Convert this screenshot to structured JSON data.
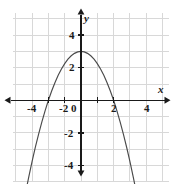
{
  "chart_data": {
    "type": "line",
    "title": "",
    "subtitle": "",
    "xlabel": "x",
    "ylabel": "y",
    "xlim": [
      -4.95,
      5.4
    ],
    "ylim": [
      -5.25,
      5.4
    ],
    "grid": true,
    "grid_step": 1,
    "legend": null,
    "xticks": [
      -4,
      -2,
      2,
      4
    ],
    "yticks": [
      4,
      2,
      -2,
      -4
    ],
    "xtick_labels": [
      "-4",
      "-2",
      "2",
      "4"
    ],
    "ytick_labels": [
      "4",
      "2",
      "-2",
      "-4"
    ],
    "origin_label": "0",
    "series": [
      {
        "name": "parabola",
        "equation": "y = -0.75x^2 + 3",
        "color": "#4a4a4a",
        "vertex": [
          0,
          3
        ],
        "roots": [
          -2,
          2
        ],
        "x": [
          -3.35,
          -3.2,
          -3.0,
          -2.8,
          -2.6,
          -2.4,
          -2.2,
          -2.0,
          -1.8,
          -1.6,
          -1.4,
          -1.2,
          -1.0,
          -0.8,
          -0.6,
          -0.4,
          -0.2,
          0.0,
          0.2,
          0.4,
          0.6,
          0.8,
          1.0,
          1.2,
          1.4,
          1.6,
          1.8,
          2.0,
          2.2,
          2.4,
          2.6,
          2.8,
          3.0,
          3.2,
          3.35
        ],
        "y": [
          -5.42,
          -4.68,
          -3.75,
          -2.88,
          -2.07,
          -1.32,
          -0.63,
          0.0,
          0.57,
          1.08,
          1.53,
          1.92,
          2.25,
          2.52,
          2.73,
          2.88,
          2.97,
          3.0,
          2.97,
          2.88,
          2.73,
          2.52,
          2.25,
          1.92,
          1.53,
          1.08,
          0.57,
          0.0,
          -0.63,
          -1.32,
          -2.07,
          -2.88,
          -3.75,
          -4.68,
          -5.42
        ]
      }
    ],
    "colors": {
      "grid": "#d8d8d8",
      "axis": "#1a1a1a",
      "curve": "#4a4a4a",
      "background": "#ffffff",
      "label": "#1a1a1a"
    },
    "tick_labels_detail": {
      "x_neg4": "-4",
      "x_neg2": "-2",
      "x_zero": "0",
      "x_pos2": "2",
      "x_pos4": "4",
      "y_pos4": "4",
      "y_pos2": "2",
      "y_neg2": "-2",
      "y_neg4": "-4",
      "axis_x": "x",
      "axis_y": "y"
    }
  }
}
